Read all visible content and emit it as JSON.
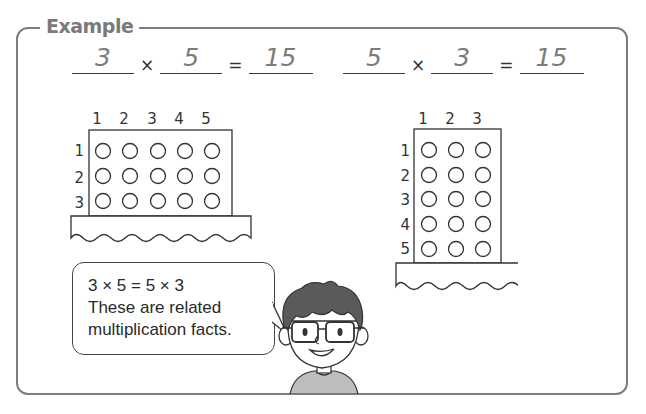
{
  "example": {
    "title": "Example",
    "equations": [
      {
        "factor1": "3",
        "times": "×",
        "factor2": "5",
        "equals": "=",
        "product": "15"
      },
      {
        "factor1": "5",
        "times": "×",
        "factor2": "3",
        "equals": "=",
        "product": "15"
      }
    ],
    "arrays": [
      {
        "name": "3-by-5-array",
        "column_labels": [
          "1",
          "2",
          "3",
          "4",
          "5"
        ],
        "row_labels": [
          "1",
          "2",
          "3"
        ],
        "rows": 3,
        "cols": 5
      },
      {
        "name": "5-by-3-array",
        "column_labels": [
          "1",
          "2",
          "3"
        ],
        "row_labels": [
          "1",
          "2",
          "3",
          "4",
          "5"
        ],
        "rows": 5,
        "cols": 3
      }
    ],
    "speech_bubble": {
      "lines": [
        "3 × 5 = 5 × 3",
        "These are related",
        "multiplication facts."
      ]
    },
    "character": "boy-with-glasses",
    "colors": {
      "frame": "#7d7d7d",
      "title": "#7a7a7a",
      "answer": "#7c7c7c",
      "ink": "#333333",
      "hair": "#5a5a5a",
      "shirt": "#bdbdbd"
    }
  }
}
